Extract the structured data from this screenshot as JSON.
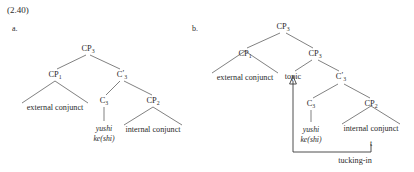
{
  "example_number": "(2.40)",
  "trees": [
    {
      "id": "tree-a",
      "letter": "a.",
      "root": "CP",
      "root_sub": "3",
      "nodes": {
        "cp1": "CP",
        "cp1_sub": "1",
        "cbar3": "C",
        "cbar3_prime": "′",
        "cbar3_sub": "3",
        "c3": "C",
        "c3_sub": "3",
        "cp2": "CP",
        "cp2_sub": "2"
      },
      "leaves": {
        "external_conjunct": "external conjunct",
        "internal_conjunct": "internal conjunct",
        "head_line1": "yushi",
        "head_line2": "ke(shi)"
      }
    },
    {
      "id": "tree-b",
      "letter": "b.",
      "root": "CP",
      "root_sub": "3",
      "nodes": {
        "cp1": "CP",
        "cp1_sub": "1",
        "cp3": "CP",
        "cp3_sub": "3",
        "cbar3": "C",
        "cbar3_prime": "′",
        "cbar3_sub": "3",
        "c3": "C",
        "c3_sub": "3",
        "cp2": "CP",
        "cp2_sub": "2"
      },
      "leaves": {
        "external_conjunct": "external conjunct",
        "topic": "topic",
        "internal_conjunct": "internal conjunct",
        "head_line1": "yushi",
        "head_line2": "ke(shi)",
        "trace": "t"
      },
      "annotation": "tucking-in"
    }
  ],
  "colors": {
    "text": "#2b2b2b",
    "line": "#4a4a4a",
    "background": "#ffffff"
  }
}
